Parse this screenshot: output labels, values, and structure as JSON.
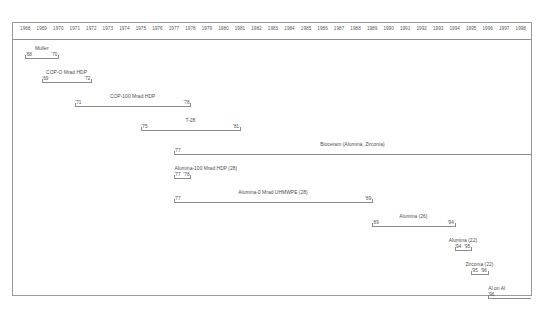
{
  "chart_data": {
    "type": "bar",
    "orientation": "horizontal-timeline",
    "title": "",
    "subtitle": "",
    "xlabel": "",
    "ylabel": "",
    "xlim": [
      1968,
      1998
    ],
    "grid": false,
    "legend": "none",
    "axis_years": [
      "1968",
      "1969",
      "1970",
      "1971",
      "1972",
      "1973",
      "1974",
      "1975",
      "1976",
      "1977",
      "1978",
      "1979",
      "1980",
      "1981",
      "1982",
      "1983",
      "1984",
      "1985",
      "1986",
      "1987",
      "1988",
      "1989",
      "1990",
      "1991",
      "1992",
      "1993",
      "1994",
      "1995",
      "1996",
      "1997",
      "1998"
    ],
    "categories": [
      "Muller",
      "COP-O Mrad HDP",
      "COP-100 Mrad HDP",
      "T-28",
      "Bioceram (Alumina, Zirconia)",
      "Alumina-100 Mrad HDP (28)",
      "Alumina-0 Mrad UHMWPE (28)",
      "Alumina (26)",
      "Alumina (22)",
      "Zirconia (22)",
      "Al on Al"
    ],
    "series": [
      {
        "name": "Muller",
        "label": "Muller",
        "start": 1968,
        "end": 1970,
        "start_label": "'68",
        "end_label": "'70",
        "show_end_label": true,
        "label_align": "centered"
      },
      {
        "name": "COP-O Mrad HDP",
        "label": "COP-O Mrad HDP",
        "start": 1969,
        "end": 1972,
        "start_label": "'69",
        "end_label": "'72",
        "show_end_label": true,
        "label_align": "centered"
      },
      {
        "name": "COP-100 Mrad HDP",
        "label": "COP-100 Mrad HDP",
        "start": 1971,
        "end": 1978,
        "start_label": "'71",
        "end_label": "'78",
        "show_end_label": true,
        "label_align": "centered"
      },
      {
        "name": "T-28",
        "label": "T-28",
        "start": 1975,
        "end": 1981,
        "start_label": "'75",
        "end_label": "'81",
        "show_end_label": true,
        "label_align": "centered"
      },
      {
        "name": "Bioceram",
        "label": "Bioceram (Alumina, Zirconia)",
        "start": 1977,
        "end": 1998,
        "start_label": "'77",
        "end_label": "",
        "show_end_label": false,
        "label_align": "centered"
      },
      {
        "name": "Alumina-100 Mrad HDP (28)",
        "label": "Alumina-100 Mrad HDP (28)",
        "start": 1977,
        "end": 1978,
        "start_label": "'77",
        "end_label": "'78",
        "show_end_label": true,
        "label_align": "left"
      },
      {
        "name": "Alumina-0 Mrad UHMWPE (28)",
        "label": "Alumina-0 Mrad UHMWPE (28)",
        "start": 1977,
        "end": 1989,
        "start_label": "'77",
        "end_label": "'89",
        "show_end_label": true,
        "label_align": "centered"
      },
      {
        "name": "Alumina (26)",
        "label": "Alumina (26)",
        "start": 1989,
        "end": 1994,
        "start_label": "'89",
        "end_label": "'94",
        "show_end_label": true,
        "label_align": "centered"
      },
      {
        "name": "Alumina (22)",
        "label": "Alumina (22)",
        "start": 1994,
        "end": 1995,
        "start_label": "'94",
        "end_label": "'95",
        "show_end_label": true,
        "label_align": "centered"
      },
      {
        "name": "Zirconia (22)",
        "label": "Zirconia (22)",
        "start": 1995,
        "end": 1996,
        "start_label": "'95",
        "end_label": "'96",
        "show_end_label": true,
        "label_align": "centered"
      },
      {
        "name": "Al on Al",
        "label": "Al on Al",
        "start": 1996,
        "end": 1998,
        "start_label": "'96",
        "end_label": "",
        "show_end_label": false,
        "label_align": "left"
      }
    ]
  },
  "colors": {
    "frame_border": "#9a9a9a",
    "axis_line": "#8d8d8d",
    "bar": "#8a8a8a",
    "text": "#4c4c50",
    "background": "#ffffff"
  }
}
